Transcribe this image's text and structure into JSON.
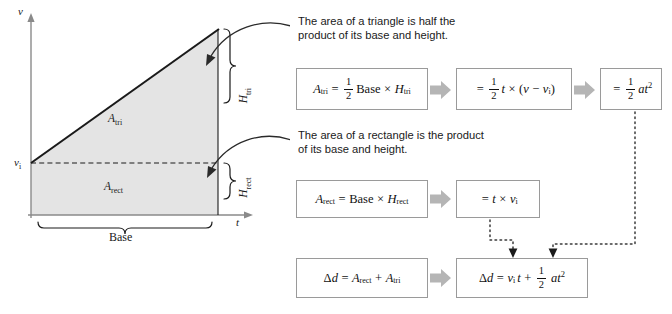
{
  "graph": {
    "y_axis_label": "v",
    "x_axis_label": "t",
    "initial_velocity_label": "v",
    "initial_velocity_sub": "i",
    "triangle_area_label": "A",
    "triangle_area_sub": "tri",
    "rect_area_label": "A",
    "rect_area_sub": "rect",
    "height_tri_label": "H",
    "height_tri_sub": "tri",
    "height_rect_label": "H",
    "height_rect_sub": "rect",
    "base_label": "Base",
    "fill_color": "#e4e4e4",
    "line_color": "#1a1a1a",
    "axis_color": "#8a8a8a"
  },
  "captions": {
    "triangle": "The area of a triangle is half the\nproduct of its base and height.",
    "rectangle": "The area of a rectangle is the product\nof its base and height."
  },
  "formulas": {
    "tri_1": "A_tri = 1/2 Base × H_tri",
    "tri_2": "= 1/2 t × (v − v_i)",
    "tri_3": "= 1/2 at^2",
    "rect_1": "A_rect = Base × H_rect",
    "rect_2": "= t × v_i",
    "sum_1": "Δd = A_rect + A_tri",
    "sum_2": "Δd = v_i t + 1/2 at^2"
  },
  "symbols": {
    "A": "A",
    "H": "H",
    "t": "t",
    "v": "v",
    "a": "a",
    "d": "d",
    "delta": "Δ",
    "equals": "=",
    "plus": "+",
    "minus": "−",
    "times": "×",
    "one": "1",
    "two": "2",
    "sup_two": "2",
    "base_word": "Base",
    "sub_tri": "tri",
    "sub_rect": "rect",
    "sub_i": "i",
    "lparen": "(",
    "rparen": ")"
  },
  "colors": {
    "box_border": "#9a9a9a",
    "block_arrow": "#b5b5b5",
    "dotted_line": "#4a4a4a",
    "text": "#1a1a1a"
  }
}
